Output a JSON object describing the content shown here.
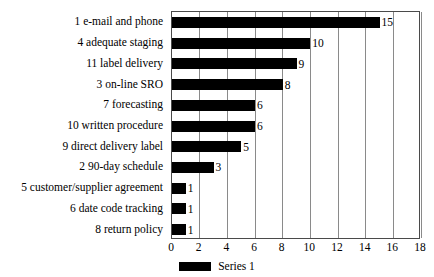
{
  "chart_data": {
    "type": "bar",
    "orientation": "horizontal",
    "title": "",
    "xlabel": "",
    "ylabel": "",
    "categories": [
      "1 e-mail and phone",
      "4 adequate staging",
      "11 label delivery",
      "3 on-line SRO",
      "7 forecasting",
      "10 written procedure",
      "9 direct delivery label",
      "2 90-day schedule",
      "5 customer/supplier agreement",
      "6 date code tracking",
      "8 return policy"
    ],
    "values": [
      15,
      10,
      9,
      8,
      6,
      6,
      5,
      3,
      1,
      1,
      1
    ],
    "data_labels": [
      "15",
      "10",
      "9",
      "8",
      "6",
      "6",
      "5",
      "3",
      "1",
      "1",
      "1"
    ],
    "series": [
      {
        "name": "Series 1",
        "values": [
          15,
          10,
          9,
          8,
          6,
          6,
          5,
          3,
          1,
          1,
          1
        ],
        "color": "#000000"
      }
    ],
    "xlim": [
      0,
      18
    ],
    "xticks": [
      0,
      2,
      4,
      6,
      8,
      10,
      12,
      14,
      16,
      18
    ],
    "xtick_labels": [
      "0",
      "2",
      "4",
      "6",
      "8",
      "10",
      "12",
      "14",
      "16",
      "18"
    ],
    "grid": "vertical",
    "legend_position": "bottom-center",
    "plot_background": "#ffffff",
    "bar_color": "#000000",
    "gridline_color": "#8a8a8a",
    "axis_color": "#4a4a4a"
  },
  "legend": {
    "entries": [
      {
        "label": "Series 1",
        "color": "#000000"
      }
    ]
  }
}
